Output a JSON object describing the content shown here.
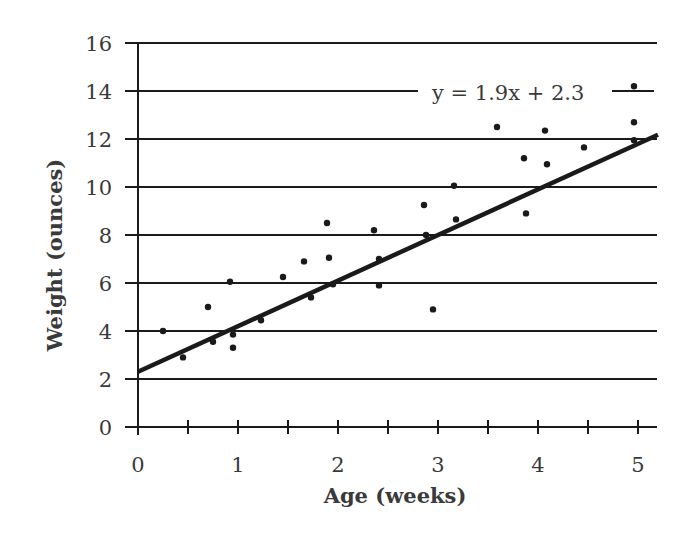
{
  "chart_data": {
    "type": "scatter",
    "title": "",
    "xlabel": "Age (weeks)",
    "ylabel": "Weight (ounces)",
    "xlim": [
      0,
      5.2
    ],
    "ylim": [
      0,
      16
    ],
    "x_ticks": [
      0,
      1,
      2,
      3,
      4,
      5
    ],
    "x_minor_ticks": [
      0.5,
      1.5,
      2.5,
      3.5,
      4.5
    ],
    "y_ticks": [
      0,
      2,
      4,
      6,
      8,
      10,
      12,
      14,
      16
    ],
    "grid": "horizontal",
    "legend": null,
    "series": [
      {
        "name": "Observations",
        "kind": "scatter",
        "points": [
          [
            0.25,
            4.0
          ],
          [
            0.45,
            2.9
          ],
          [
            0.7,
            5.0
          ],
          [
            0.75,
            3.55
          ],
          [
            0.92,
            6.05
          ],
          [
            0.95,
            3.85
          ],
          [
            0.95,
            3.3
          ],
          [
            1.23,
            4.45
          ],
          [
            1.45,
            6.25
          ],
          [
            1.66,
            6.9
          ],
          [
            1.73,
            5.4
          ],
          [
            1.89,
            8.5
          ],
          [
            1.91,
            7.05
          ],
          [
            1.95,
            5.95
          ],
          [
            2.36,
            8.2
          ],
          [
            2.41,
            7.0
          ],
          [
            2.41,
            5.9
          ],
          [
            2.86,
            9.25
          ],
          [
            2.88,
            8.0
          ],
          [
            2.95,
            4.9
          ],
          [
            3.16,
            10.05
          ],
          [
            3.18,
            8.65
          ],
          [
            3.59,
            12.5
          ],
          [
            3.86,
            11.2
          ],
          [
            3.88,
            8.9
          ],
          [
            4.07,
            12.35
          ],
          [
            4.09,
            10.95
          ],
          [
            4.46,
            11.65
          ],
          [
            4.96,
            14.2
          ],
          [
            4.96,
            12.7
          ],
          [
            4.96,
            11.95
          ]
        ]
      },
      {
        "name": "Line of best fit",
        "kind": "line",
        "slope": 1.9,
        "intercept": 2.3,
        "x_range": [
          0,
          5.2
        ]
      }
    ],
    "annotations": [
      {
        "text": "y = 1.9x + 2.3",
        "near": [
          4.0,
          14
        ]
      }
    ]
  },
  "labels": {
    "xlabel": "Age (weeks)",
    "ylabel": "Weight (ounces)",
    "equation": "y = 1.9x + 2.3"
  },
  "colors": {
    "ink": "#1a1a1a",
    "text": "#3a3a3a"
  }
}
